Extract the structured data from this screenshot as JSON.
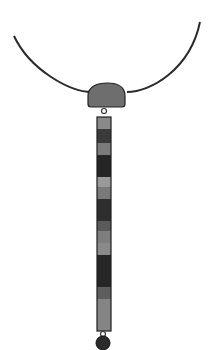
{
  "image": {
    "subject": "pendant necklace illustration",
    "background_color": "#ffffff",
    "cord_color": "#2a2a2a",
    "pendant_top_color": "#6e6e6e",
    "disc_color": "#2b2b2b",
    "bar_segments": [
      {
        "y": 117,
        "h": 12,
        "color": "#8a8a8a"
      },
      {
        "y": 129,
        "h": 14,
        "color": "#3a3a3a"
      },
      {
        "y": 143,
        "h": 12,
        "color": "#7a7a7a"
      },
      {
        "y": 155,
        "h": 22,
        "color": "#252525"
      },
      {
        "y": 177,
        "h": 10,
        "color": "#9a9a9a"
      },
      {
        "y": 187,
        "h": 12,
        "color": "#7a7a7a"
      },
      {
        "y": 199,
        "h": 22,
        "color": "#2e2e2e"
      },
      {
        "y": 221,
        "h": 10,
        "color": "#5a5a5a"
      },
      {
        "y": 231,
        "h": 12,
        "color": "#7e7e7e"
      },
      {
        "y": 243,
        "h": 12,
        "color": "#8a8a8a"
      },
      {
        "y": 255,
        "h": 32,
        "color": "#262626"
      },
      {
        "y": 287,
        "h": 12,
        "color": "#5e5e5e"
      },
      {
        "y": 299,
        "h": 32,
        "color": "#858585"
      }
    ]
  }
}
